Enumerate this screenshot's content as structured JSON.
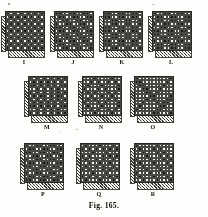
{
  "figure": {
    "caption": "Fig. 165.",
    "grid_size": 11,
    "colors": {
      "ink": "#1a1a18",
      "paper": "#fbfbf8",
      "rule": "#4a4a46",
      "hatch": "#24241f"
    }
  },
  "diagrams": [
    {
      "label": "I",
      "rows": [
        "10101010101",
        "01010101010",
        "10101010101",
        "01010101010",
        "10101010101",
        "01010101010",
        "10101010101",
        "01010101010",
        "10101010101",
        "01010101010",
        "10101010101"
      ]
    },
    {
      "label": "J",
      "rows": [
        "11001100110",
        "01100110011",
        "00110011001",
        "10011001100",
        "11001100110",
        "01100110011",
        "00110011001",
        "10011001100",
        "11001100110",
        "01100110011",
        "00110011001"
      ]
    },
    {
      "label": "K",
      "rows": [
        "11001100110",
        "11001100110",
        "00110011001",
        "00110011001",
        "11001100110",
        "11001100110",
        "00110011001",
        "00110011001",
        "11001100110",
        "11001100110",
        "00110011001"
      ]
    },
    {
      "label": "L",
      "rows": [
        "10011001100",
        "01100110011",
        "01100110011",
        "10011001100",
        "00110011001",
        "11001100110",
        "11001100110",
        "00110011001",
        "10011001100",
        "01100110011",
        "01100110011"
      ]
    },
    {
      "label": "M",
      "rows": [
        "10101010101",
        "01010101010",
        "11010101011",
        "00101010100",
        "10101010101",
        "01011010110",
        "10101010101",
        "01010101010",
        "11010101011",
        "00101010100",
        "10101010101"
      ]
    },
    {
      "label": "N",
      "rows": [
        "00010000100",
        "00101001010",
        "01000100001",
        "10001010001",
        "01010001010",
        "00100100100",
        "01010001010",
        "10001010001",
        "01000100001",
        "00101001010",
        "00010000100"
      ]
    },
    {
      "label": "O",
      "rows": [
        "10000000001",
        "11000000010",
        "01100000100",
        "00110001000",
        "00011010000",
        "00001100001",
        "00010100011",
        "00100010110",
        "01000001100",
        "10000011000",
        "00000110001"
      ]
    },
    {
      "label": "P",
      "rows": [
        "10011001100",
        "01100110011",
        "11001100110",
        "00110011001",
        "10011001100",
        "01100110011",
        "11001100110",
        "00110011001",
        "10011001100",
        "01100110011",
        "11001100110"
      ]
    },
    {
      "label": "Q",
      "rows": [
        "01000100010",
        "10101010101",
        "00010001000",
        "10100010101",
        "01001010010",
        "00100100100",
        "01001010010",
        "10100010101",
        "00010001000",
        "10101010101",
        "01000100010"
      ]
    },
    {
      "label": "R",
      "rows": [
        "10000010000",
        "01000101000",
        "00100010100",
        "00010001010",
        "10001000101",
        "01000100010",
        "00100010001",
        "00010001000",
        "10001000100",
        "01000100010",
        "00100010001"
      ]
    }
  ],
  "layout": {
    "rows": [
      {
        "y": 11,
        "items": [
          {
            "x": 5,
            "label_x": 24
          },
          {
            "x": 54,
            "label_x": 73
          },
          {
            "x": 103,
            "label_x": 122
          },
          {
            "x": 152,
            "label_x": 171
          }
        ],
        "label_y": 59
      },
      {
        "y": 76,
        "items": [
          {
            "x": 28,
            "label_x": 47
          },
          {
            "x": 82,
            "label_x": 101
          },
          {
            "x": 134,
            "label_x": 153
          }
        ],
        "label_y": 124
      },
      {
        "y": 143,
        "items": [
          {
            "x": 24,
            "label_x": 43
          },
          {
            "x": 80,
            "label_x": 99
          },
          {
            "x": 134,
            "label_x": 153
          }
        ],
        "label_y": 191
      }
    ],
    "caption_y": 201
  }
}
